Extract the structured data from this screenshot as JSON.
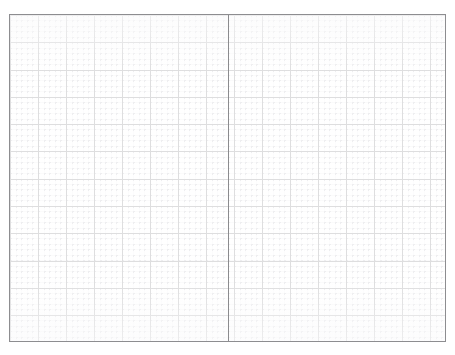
{
  "document": {
    "title": "Graph Paper Notebook Spread",
    "page_width": 455,
    "page_height": 355,
    "background_color": "#ffffff"
  },
  "spread": {
    "name": "two-page-graph-paper-spread",
    "border_color": "#8d8d90",
    "border_width_px": 1,
    "left_px": 9,
    "top_px": 14,
    "width_px": 437,
    "height_px": 328,
    "paper_color": "#ffffff"
  },
  "fold": {
    "name": "center-binding-fold",
    "position_px": 228,
    "color": "#8b8b8e",
    "width_px": 1
  },
  "grid": {
    "style": "engineering-graph-paper",
    "major_color": "#dededf",
    "minor_color": "#e9e9ec",
    "major_pitch_x_px": 28,
    "major_pitch_y_px": 27.3,
    "minor_pitch_x_px": 5.6,
    "minor_pitch_y_px": 5.45,
    "subdivisions_per_major": 5,
    "minor_line_style": "dotted"
  },
  "pages": [
    {
      "name": "left-page",
      "label": "Left page",
      "content": ""
    },
    {
      "name": "right-page",
      "label": "Right page",
      "content": ""
    }
  ]
}
